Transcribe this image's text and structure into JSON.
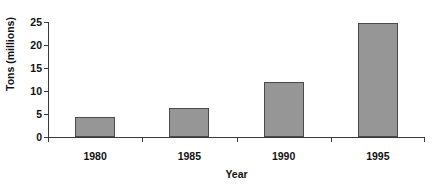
{
  "chart_data": {
    "type": "bar",
    "title": "",
    "xlabel": "Year",
    "ylabel": "Tons (millions)",
    "categories": [
      "1980",
      "1985",
      "1990",
      "1995"
    ],
    "values": [
      4.4,
      6.4,
      11.9,
      24.7
    ],
    "ylim": [
      0,
      25
    ],
    "yticks": [
      0,
      5,
      10,
      15,
      20,
      25
    ],
    "ytick_labels": [
      "0",
      "5",
      "10",
      "15",
      "20",
      "25"
    ],
    "grid": false,
    "legend": false,
    "series": [
      {
        "name": "Tons (millions)",
        "values": [
          4.4,
          6.4,
          11.9,
          24.7
        ]
      }
    ],
    "colors": {
      "bar_fill": "#969696",
      "bar_edge": "#4a4a4a",
      "axis": "#3a3a3a",
      "text": "#111111",
      "background": "#ffffff"
    }
  },
  "figure": {
    "clipped_title": "",
    "x_axis_title": "Year",
    "y_axis_title": "Tons (millions)"
  }
}
